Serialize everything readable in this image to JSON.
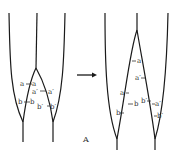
{
  "caption": "A",
  "left_panel": {
    "labels": {
      "a_left": "a",
      "a_right": "a",
      "ap_left": "a′",
      "ap_right": "a′",
      "b_left": "b",
      "b_right": "b",
      "bp_left": "b′",
      "bp_right": "b′"
    }
  },
  "right_panel": {
    "labels": {
      "a_upper": "a",
      "ap_upper": "a′",
      "a_lower": "a",
      "b_upper": "b",
      "b_lower": "b",
      "bp_left": "b′",
      "ap_lower": "a′",
      "bp_lower": "b′"
    }
  },
  "arrow": {
    "direction": "right"
  }
}
